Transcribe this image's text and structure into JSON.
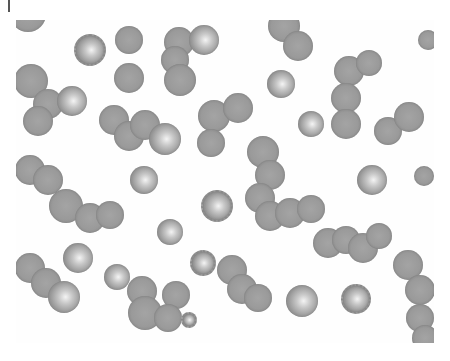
{
  "image": {
    "subject": "micrograph of red blood cells (spherocytes and echinocytes), many in overlapping chains, on white background",
    "background_color": "#ffffff",
    "cell_color": "#9a9a9a",
    "highlight_color": "#f4f4f4"
  },
  "cells": [
    {
      "x": 28,
      "y": 14,
      "r": 18,
      "t": "plain"
    },
    {
      "x": 88,
      "y": 48,
      "r": 14,
      "t": "spiky"
    },
    {
      "x": 129,
      "y": 40,
      "r": 14,
      "t": "plain"
    },
    {
      "x": 129,
      "y": 78,
      "r": 15,
      "t": "plain"
    },
    {
      "x": 179,
      "y": 42,
      "r": 15,
      "t": "plain"
    },
    {
      "x": 204,
      "y": 40,
      "r": 15,
      "t": "lit"
    },
    {
      "x": 175,
      "y": 60,
      "r": 14,
      "t": "plain"
    },
    {
      "x": 180,
      "y": 80,
      "r": 16,
      "t": "plain"
    },
    {
      "x": 284,
      "y": 26,
      "r": 16,
      "t": "plain"
    },
    {
      "x": 298,
      "y": 46,
      "r": 15,
      "t": "plain"
    },
    {
      "x": 31,
      "y": 81,
      "r": 17,
      "t": "plain"
    },
    {
      "x": 48,
      "y": 104,
      "r": 15,
      "t": "plain"
    },
    {
      "x": 72,
      "y": 101,
      "r": 15,
      "t": "lit"
    },
    {
      "x": 38,
      "y": 121,
      "r": 15,
      "t": "plain"
    },
    {
      "x": 114,
      "y": 120,
      "r": 15,
      "t": "plain"
    },
    {
      "x": 129,
      "y": 136,
      "r": 15,
      "t": "plain"
    },
    {
      "x": 145,
      "y": 125,
      "r": 15,
      "t": "plain"
    },
    {
      "x": 165,
      "y": 139,
      "r": 16,
      "t": "lit"
    },
    {
      "x": 281,
      "y": 84,
      "r": 14,
      "t": "lit"
    },
    {
      "x": 214,
      "y": 116,
      "r": 16,
      "t": "plain"
    },
    {
      "x": 238,
      "y": 108,
      "r": 15,
      "t": "plain"
    },
    {
      "x": 211,
      "y": 143,
      "r": 14,
      "t": "plain"
    },
    {
      "x": 311,
      "y": 124,
      "r": 13,
      "t": "lit"
    },
    {
      "x": 349,
      "y": 71,
      "r": 15,
      "t": "plain"
    },
    {
      "x": 369,
      "y": 63,
      "r": 13,
      "t": "plain"
    },
    {
      "x": 346,
      "y": 98,
      "r": 15,
      "t": "plain"
    },
    {
      "x": 346,
      "y": 124,
      "r": 15,
      "t": "plain"
    },
    {
      "x": 388,
      "y": 131,
      "r": 14,
      "t": "plain"
    },
    {
      "x": 409,
      "y": 117,
      "r": 15,
      "t": "plain"
    },
    {
      "x": 428,
      "y": 40,
      "r": 10,
      "t": "plain"
    },
    {
      "x": 30,
      "y": 170,
      "r": 15,
      "t": "plain"
    },
    {
      "x": 48,
      "y": 180,
      "r": 15,
      "t": "plain"
    },
    {
      "x": 66,
      "y": 206,
      "r": 17,
      "t": "plain"
    },
    {
      "x": 90,
      "y": 218,
      "r": 15,
      "t": "plain"
    },
    {
      "x": 110,
      "y": 215,
      "r": 14,
      "t": "plain"
    },
    {
      "x": 144,
      "y": 180,
      "r": 14,
      "t": "lit"
    },
    {
      "x": 215,
      "y": 204,
      "r": 14,
      "t": "spiky"
    },
    {
      "x": 170,
      "y": 232,
      "r": 13,
      "t": "lit"
    },
    {
      "x": 263,
      "y": 152,
      "r": 16,
      "t": "plain"
    },
    {
      "x": 270,
      "y": 175,
      "r": 15,
      "t": "plain"
    },
    {
      "x": 260,
      "y": 198,
      "r": 15,
      "t": "plain"
    },
    {
      "x": 270,
      "y": 216,
      "r": 15,
      "t": "plain"
    },
    {
      "x": 290,
      "y": 213,
      "r": 15,
      "t": "plain"
    },
    {
      "x": 311,
      "y": 209,
      "r": 14,
      "t": "plain"
    },
    {
      "x": 372,
      "y": 180,
      "r": 15,
      "t": "lit"
    },
    {
      "x": 424,
      "y": 176,
      "r": 10,
      "t": "plain"
    },
    {
      "x": 328,
      "y": 243,
      "r": 15,
      "t": "plain"
    },
    {
      "x": 346,
      "y": 240,
      "r": 14,
      "t": "plain"
    },
    {
      "x": 363,
      "y": 248,
      "r": 15,
      "t": "plain"
    },
    {
      "x": 379,
      "y": 236,
      "r": 13,
      "t": "plain"
    },
    {
      "x": 408,
      "y": 265,
      "r": 15,
      "t": "plain"
    },
    {
      "x": 420,
      "y": 290,
      "r": 15,
      "t": "plain"
    },
    {
      "x": 420,
      "y": 318,
      "r": 14,
      "t": "plain"
    },
    {
      "x": 425,
      "y": 338,
      "r": 13,
      "t": "plain"
    },
    {
      "x": 78,
      "y": 258,
      "r": 15,
      "t": "lit"
    },
    {
      "x": 117,
      "y": 277,
      "r": 13,
      "t": "lit"
    },
    {
      "x": 201,
      "y": 261,
      "r": 11,
      "t": "spiky"
    },
    {
      "x": 302,
      "y": 301,
      "r": 16,
      "t": "lit"
    },
    {
      "x": 354,
      "y": 297,
      "r": 13,
      "t": "spiky"
    },
    {
      "x": 30,
      "y": 268,
      "r": 15,
      "t": "plain"
    },
    {
      "x": 46,
      "y": 283,
      "r": 15,
      "t": "plain"
    },
    {
      "x": 64,
      "y": 297,
      "r": 16,
      "t": "lit"
    },
    {
      "x": 142,
      "y": 291,
      "r": 15,
      "t": "plain"
    },
    {
      "x": 145,
      "y": 313,
      "r": 17,
      "t": "plain"
    },
    {
      "x": 176,
      "y": 295,
      "r": 14,
      "t": "plain"
    },
    {
      "x": 168,
      "y": 318,
      "r": 14,
      "t": "plain"
    },
    {
      "x": 187,
      "y": 318,
      "r": 6,
      "t": "spiky"
    },
    {
      "x": 232,
      "y": 270,
      "r": 15,
      "t": "plain"
    },
    {
      "x": 242,
      "y": 289,
      "r": 15,
      "t": "plain"
    },
    {
      "x": 258,
      "y": 298,
      "r": 14,
      "t": "plain"
    }
  ]
}
